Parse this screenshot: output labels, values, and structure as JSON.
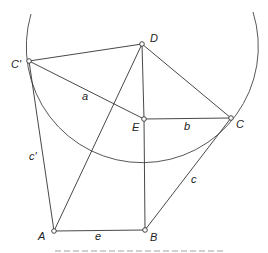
{
  "figure": {
    "points": [
      {
        "id": "C_prime",
        "label": "C'"
      },
      {
        "id": "D",
        "label": "D"
      },
      {
        "id": "E",
        "label": "E"
      },
      {
        "id": "C",
        "label": "C"
      },
      {
        "id": "A",
        "label": "A"
      },
      {
        "id": "B",
        "label": "B"
      }
    ],
    "segments": [
      {
        "from": "C_prime",
        "to": "D"
      },
      {
        "from": "C_prime",
        "to": "E",
        "label": "a"
      },
      {
        "from": "E",
        "to": "C",
        "label": "b"
      },
      {
        "from": "D",
        "to": "C"
      },
      {
        "from": "D",
        "to": "E"
      },
      {
        "from": "D",
        "to": "A"
      },
      {
        "from": "E",
        "to": "B"
      },
      {
        "from": "C_prime",
        "to": "A",
        "label": "c'"
      },
      {
        "from": "A",
        "to": "B",
        "label": "e"
      },
      {
        "from": "B",
        "to": "C",
        "label": "c"
      }
    ],
    "labels": {
      "C_prime": "C'",
      "D": "D",
      "E": "E",
      "C": "C",
      "A": "A",
      "B": "B",
      "a": "a",
      "b": "b",
      "c": "c",
      "c_prime": "c'",
      "e": "e"
    }
  }
}
